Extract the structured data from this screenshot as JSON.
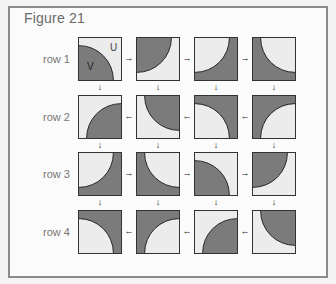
{
  "figure": {
    "title": "Figure 21",
    "colors": {
      "dark": "#7b7b7b",
      "light": "#ececec",
      "stroke": "#222222"
    },
    "tile_annotations": {
      "u_label": "U",
      "v_label": "V"
    },
    "rows": [
      {
        "label": "row 1",
        "direction": "right",
        "tiles": [
          {
            "mode": "dark-quarter",
            "corner": "bottom-left"
          },
          {
            "mode": "dark-quarter",
            "corner": "top-left"
          },
          {
            "mode": "light-quarter",
            "corner": "top-left"
          },
          {
            "mode": "light-quarter",
            "corner": "top-right"
          }
        ]
      },
      {
        "label": "row 2",
        "direction": "left",
        "tiles": [
          {
            "mode": "dark-quarter",
            "corner": "bottom-right"
          },
          {
            "mode": "dark-quarter",
            "corner": "top-right"
          },
          {
            "mode": "light-quarter",
            "corner": "bottom-left"
          },
          {
            "mode": "light-quarter",
            "corner": "bottom-right"
          }
        ]
      },
      {
        "label": "row 3",
        "direction": "right",
        "tiles": [
          {
            "mode": "light-quarter",
            "corner": "top-left"
          },
          {
            "mode": "light-quarter",
            "corner": "top-right"
          },
          {
            "mode": "dark-quarter",
            "corner": "bottom-left"
          },
          {
            "mode": "dark-quarter",
            "corner": "top-left"
          }
        ]
      },
      {
        "label": "row 4",
        "direction": "left",
        "tiles": [
          {
            "mode": "light-quarter",
            "corner": "bottom-left"
          },
          {
            "mode": "light-quarter",
            "corner": "bottom-right"
          },
          {
            "mode": "dark-quarter",
            "corner": "bottom-right"
          },
          {
            "mode": "dark-quarter",
            "corner": "top-right"
          }
        ]
      }
    ],
    "arrows": {
      "right": "→",
      "left": "←",
      "down": "↓"
    }
  }
}
